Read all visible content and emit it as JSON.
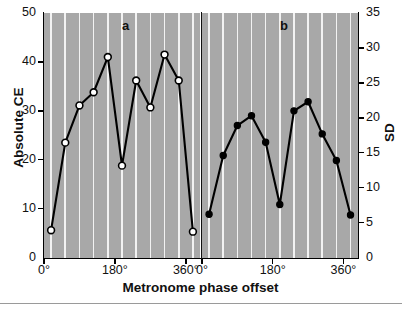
{
  "figure": {
    "xlabel": "Metronome phase offset",
    "ylabel_left": "Absolute CE",
    "ylabel_right": "SD",
    "panel_a_letter": "a",
    "panel_b_letter": "b",
    "plot_background": "#a8a8a8",
    "gridline_color": "#f2f2f2",
    "line_color": "#000000",
    "marker_open_fill": "#ffffff",
    "marker_closed_fill": "#000000"
  },
  "axes": {
    "left_ticks": [
      "0",
      "10",
      "20",
      "30",
      "40",
      "50"
    ],
    "right_ticks": [
      "0",
      "5",
      "10",
      "15",
      "20",
      "25",
      "30",
      "35"
    ],
    "x_ticks_panel_a": [
      "0°",
      "180°",
      "360°"
    ],
    "x_ticks_panel_b": [
      "0°",
      "180°",
      "360°"
    ]
  },
  "chart_data": [
    {
      "type": "line",
      "title": "a",
      "xlabel": "Metronome phase offset",
      "ylabel": "Absolute CE",
      "ylim": [
        0,
        50
      ],
      "xlim": [
        0,
        396
      ],
      "grid": true,
      "legend": "none",
      "marker": "open-circle",
      "x": [
        18,
        54,
        90,
        126,
        162,
        198,
        234,
        270,
        306,
        342,
        378
      ],
      "xtick_values": [
        0,
        180,
        360
      ],
      "xtick_labels": [
        "0°",
        "180°",
        "360°"
      ],
      "values": [
        5.6,
        23.5,
        31.1,
        33.8,
        41.0,
        18.8,
        36.2,
        30.7,
        41.5,
        36.2,
        5.3
      ]
    },
    {
      "type": "line",
      "title": "b",
      "xlabel": "Metronome phase offset",
      "ylabel": "SD",
      "ylim": [
        0,
        35
      ],
      "xlim": [
        0,
        396
      ],
      "grid": true,
      "legend": "none",
      "marker": "filled-circle",
      "x": [
        18,
        54,
        90,
        126,
        162,
        198,
        234,
        270,
        306,
        342,
        378
      ],
      "xtick_values": [
        0,
        180,
        360
      ],
      "xtick_labels": [
        "0°",
        "180°",
        "360°"
      ],
      "values": [
        6.2,
        14.6,
        18.9,
        20.3,
        16.5,
        7.6,
        21.0,
        22.3,
        17.7,
        13.9,
        6.1
      ]
    }
  ]
}
